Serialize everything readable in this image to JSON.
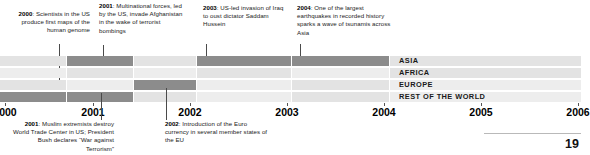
{
  "annotations_top": [
    {
      "year": "2000",
      "text": ": Scientists in the US produce first maps of the human genome",
      "align": "right",
      "x": 2,
      "y": 10,
      "width": 88,
      "leader": {
        "x": 59,
        "y": 44,
        "height": 46
      }
    },
    {
      "year": "2001",
      "text": ": Multinational forces, led by the US, invade Afghanistan in the wake of terrorist bombings",
      "align": "left",
      "x": 99,
      "y": 2,
      "width": 84,
      "leader": {
        "x": 103,
        "y": 45,
        "height": 12
      }
    },
    {
      "year": "2003",
      "text": ": US-led invasion of Iraq to oust dictator Saddam Hussein",
      "align": "left",
      "x": 203,
      "y": 4,
      "width": 82,
      "leader": {
        "x": 206,
        "y": 44,
        "height": 13
      }
    },
    {
      "year": "2004",
      "text": ": One of the largest earthquakes in recorded history sparks a wave of tsunamis across Asia",
      "align": "left",
      "x": 297,
      "y": 4,
      "width": 100,
      "leader": {
        "x": 300,
        "y": 44,
        "height": 13
      }
    }
  ],
  "annotations_bottom": [
    {
      "year": "2001",
      "text": ": Muslim extremists destroy World Trade Center in US; President Bush declares “War against Terrorism”",
      "align": "right",
      "x": 10,
      "y": 120,
      "width": 104,
      "leader": {
        "x": 101,
        "y": 93,
        "height": 27
      }
    },
    {
      "year": "2002",
      "text": ": Introduction of the Euro currency in several member states of the EU",
      "align": "left",
      "x": 165,
      "y": 120,
      "width": 104,
      "leader": {
        "x": 166,
        "y": 88,
        "height": 32
      }
    }
  ],
  "chart_data": {
    "type": "bar",
    "title": "",
    "xlabel": "",
    "ylabel": "",
    "grid": false,
    "legend_position": "right-inline",
    "categories": [
      "ASIA",
      "AFRICA",
      "EUROPE",
      "REST OF THE WORLD"
    ],
    "x_axis": {
      "years": [
        "2000",
        "2001",
        "2002",
        "2003",
        "2004",
        "2005",
        "2006"
      ],
      "positions": [
        5,
        93,
        190,
        287,
        384,
        481,
        578
      ]
    },
    "colors": {
      "dark": "#8c8c8c",
      "mid": "#c8c8c8",
      "light": "#e3e3e3",
      "lighter": "#ededed",
      "legend_band": "#efefef"
    },
    "rows": [
      {
        "name": "ASIA",
        "y": 0,
        "legend_x": 399,
        "segments": [
          {
            "x": 0,
            "w": 66,
            "shade": "light"
          },
          {
            "x": 67,
            "w": 66,
            "shade": "dark"
          },
          {
            "x": 134,
            "w": 62,
            "shade": "light"
          },
          {
            "x": 197,
            "w": 94,
            "shade": "dark"
          },
          {
            "x": 292,
            "w": 97,
            "shade": "dark"
          },
          {
            "x": 390,
            "w": 191,
            "shade": "light"
          }
        ]
      },
      {
        "name": "AFRICA",
        "y": 12,
        "legend_x": 399,
        "segments": [
          {
            "x": 0,
            "w": 66,
            "shade": "lighter"
          },
          {
            "x": 67,
            "w": 66,
            "shade": "light"
          },
          {
            "x": 134,
            "w": 62,
            "shade": "lighter"
          },
          {
            "x": 197,
            "w": 94,
            "shade": "light"
          },
          {
            "x": 292,
            "w": 97,
            "shade": "lighter"
          },
          {
            "x": 390,
            "w": 191,
            "shade": "light"
          }
        ]
      },
      {
        "name": "EUROPE",
        "y": 24,
        "legend_x": 399,
        "segments": [
          {
            "x": 0,
            "w": 66,
            "shade": "light"
          },
          {
            "x": 67,
            "w": 66,
            "shade": "lighter"
          },
          {
            "x": 134,
            "w": 62,
            "shade": "dark"
          },
          {
            "x": 197,
            "w": 94,
            "shade": "lighter"
          },
          {
            "x": 292,
            "w": 97,
            "shade": "light"
          },
          {
            "x": 390,
            "w": 191,
            "shade": "lighter"
          }
        ]
      },
      {
        "name": "REST OF THE WORLD",
        "y": 36,
        "legend_x": 399,
        "segments": [
          {
            "x": 0,
            "w": 66,
            "shade": "dark"
          },
          {
            "x": 67,
            "w": 66,
            "shade": "dark"
          },
          {
            "x": 134,
            "w": 62,
            "shade": "light"
          },
          {
            "x": 197,
            "w": 94,
            "shade": "lighter"
          },
          {
            "x": 292,
            "w": 97,
            "shade": "light"
          },
          {
            "x": 390,
            "w": 191,
            "shade": "lighter"
          }
        ]
      }
    ]
  },
  "footer": {
    "page_number": "19"
  }
}
